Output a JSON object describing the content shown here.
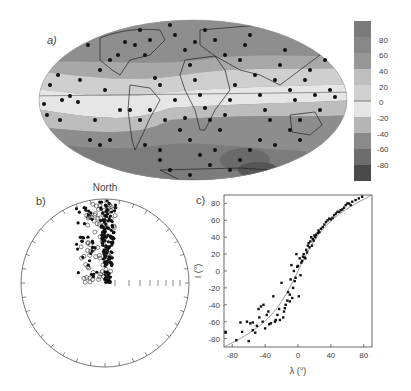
{
  "figure": {
    "panel_labels": {
      "a": "a)",
      "b": "b)",
      "c": "c)"
    }
  },
  "chart_data": [
    {
      "panel": "a",
      "type": "heatmap",
      "title": "",
      "projection": "Mollweide world map with continent outlines",
      "description": "Contoured field (inclination, degrees) with site locations shown as black dots",
      "colorbar": {
        "ticks": [
          80,
          60,
          40,
          20,
          0,
          -20,
          -40,
          -60,
          -80
        ],
        "range": [
          -90,
          90
        ],
        "levels": [
          90,
          70,
          50,
          30,
          10,
          -10,
          -30,
          -50,
          -70,
          -90
        ],
        "colors": [
          "#7a7a7a",
          "#8a8a8a",
          "#9a9a9a",
          "#bdbdbd",
          "#cfcfcf",
          "#e3e3e3",
          "#b8b8b8",
          "#8c8c8c",
          "#6f6f6f",
          "#4a4a4a"
        ]
      },
      "zero_contour": true,
      "sites_count_approx": 300
    },
    {
      "panel": "b",
      "type": "scatter",
      "title": "North",
      "projection": "equal-area stereonet (upper half populated)",
      "description": "Directions: filled circles = lower hemisphere, open circles = upper hemisphere; clustered near North",
      "axis_ticks": "tick marks every 10 degrees around circumference; inclination scale along east radius",
      "series": [
        {
          "name": "filled",
          "marker": "filled-circle",
          "count_approx": 170
        },
        {
          "name": "open",
          "marker": "open-circle",
          "count_approx": 80
        }
      ]
    },
    {
      "panel": "c",
      "type": "scatter",
      "title": "",
      "xlabel": "λ (°)",
      "ylabel": "I (°)",
      "xlim": [
        -90,
        90
      ],
      "ylim": [
        -90,
        90
      ],
      "xticks": [
        -80,
        -40,
        0,
        40,
        80
      ],
      "yticks": [
        80,
        60,
        40,
        20,
        0,
        -20,
        -40,
        -60,
        -80
      ],
      "grid": false,
      "curve": {
        "name": "dipole tan(I)=2tan(λ)",
        "style": "thin gray line"
      },
      "series": [
        {
          "name": "sites",
          "x": [
            -88,
            -88,
            -75,
            -70,
            -68,
            -62,
            -60,
            -58,
            -55,
            -55,
            -52,
            -50,
            -48,
            -47,
            -45,
            -43,
            -42,
            -40,
            -38,
            -36,
            -35,
            -33,
            -30,
            -28,
            -27,
            -25,
            -23,
            -22,
            -20,
            -18,
            -17,
            -16,
            -15,
            -13,
            -12,
            -10,
            -10,
            -9,
            -8,
            -7,
            -6,
            -5,
            -4,
            -3,
            -2,
            -1,
            0,
            1,
            2,
            3,
            4,
            5,
            6,
            7,
            8,
            9,
            10,
            11,
            12,
            13,
            14,
            15,
            16,
            17,
            18,
            19,
            20,
            21,
            22,
            24,
            25,
            26,
            28,
            30,
            32,
            34,
            36,
            38,
            40,
            42,
            44,
            46,
            48,
            50,
            52,
            54,
            56,
            58,
            60,
            62,
            64,
            66,
            70,
            74,
            78,
            82
          ],
          "y": [
            -72,
            -73,
            -82,
            -61,
            -72,
            -60,
            -83,
            -62,
            -70,
            -61,
            -73,
            -65,
            -45,
            -55,
            -42,
            -60,
            -40,
            -68,
            -52,
            -48,
            -63,
            -62,
            -30,
            -60,
            -58,
            -52,
            -45,
            -58,
            -14,
            -55,
            -48,
            -44,
            -40,
            -35,
            -25,
            -28,
            -36,
            -10,
            7,
            -32,
            -20,
            0,
            -12,
            -8,
            20,
            5,
            6,
            -30,
            15,
            -5,
            10,
            12,
            17,
            20,
            16,
            15,
            25,
            22,
            30,
            33,
            28,
            35,
            40,
            30,
            38,
            36,
            42,
            40,
            43,
            45,
            48,
            46,
            50,
            52,
            55,
            58,
            60,
            62,
            61,
            63,
            66,
            68,
            70,
            70,
            72,
            73,
            75,
            78,
            80,
            80,
            78,
            82,
            84,
            86,
            88
          ],
          "marker": "filled-square-small",
          "approx": true
        }
      ]
    }
  ]
}
